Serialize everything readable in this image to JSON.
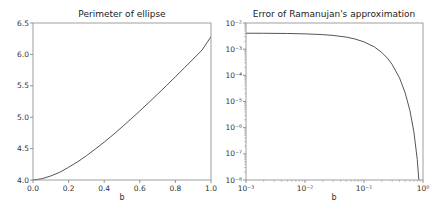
{
  "chart_data": [
    {
      "type": "line",
      "title": "Perimeter of ellipse",
      "xlabel": "b",
      "ylabel": "",
      "xscale": "linear",
      "yscale": "linear",
      "xlim": [
        0.0,
        1.0
      ],
      "ylim": [
        4.0,
        6.5
      ],
      "grid": false,
      "xticks": [
        "0.0",
        "0.2",
        "0.4",
        "0.6",
        "0.8",
        "1.0"
      ],
      "xtick_values": [
        0.0,
        0.2,
        0.4,
        0.6,
        0.8,
        1.0
      ],
      "yticks": [
        "4.0",
        "4.5",
        "5.0",
        "5.5",
        "6.0",
        "6.5"
      ],
      "ytick_values": [
        4.0,
        4.5,
        5.0,
        5.5,
        6.0,
        6.5
      ],
      "series": [
        {
          "name": "perimeter",
          "color": "#555555",
          "x": [
            0.0,
            0.05,
            0.1,
            0.15,
            0.2,
            0.25,
            0.3,
            0.35,
            0.4,
            0.45,
            0.5,
            0.55,
            0.6,
            0.65,
            0.7,
            0.75,
            0.8,
            0.85,
            0.9,
            0.95,
            1.0
          ],
          "y": [
            4.0,
            4.02,
            4.064,
            4.123,
            4.202,
            4.288,
            4.386,
            4.493,
            4.603,
            4.72,
            4.844,
            4.97,
            5.1,
            5.232,
            5.367,
            5.504,
            5.643,
            5.784,
            5.926,
            6.07,
            6.283
          ]
        }
      ]
    },
    {
      "type": "line",
      "title": "Error of Ramanujan's approximation",
      "xlabel": "b",
      "ylabel": "",
      "xscale": "log",
      "yscale": "log",
      "xlim": [
        0.001,
        1.0
      ],
      "ylim": [
        1e-08,
        0.01
      ],
      "grid": false,
      "xticks": [
        "10⁻³",
        "10⁻²",
        "10⁻¹",
        "10⁰"
      ],
      "xtick_values": [
        -3,
        -2,
        -1,
        0
      ],
      "yticks": [
        "10⁻⁸",
        "10⁻⁷",
        "10⁻⁶",
        "10⁻⁵",
        "10⁻⁴",
        "10⁻³",
        "10⁻²"
      ],
      "ytick_values": [
        -8,
        -7,
        -6,
        -5,
        -4,
        -3,
        -2
      ],
      "series": [
        {
          "name": "error",
          "color": "#555555",
          "x": [
            0.001,
            0.002,
            0.005,
            0.01,
            0.02,
            0.03,
            0.05,
            0.07,
            0.1,
            0.15,
            0.2,
            0.25,
            0.3,
            0.4,
            0.5,
            0.6,
            0.7,
            0.8,
            0.85
          ],
          "y": [
            0.00407,
            0.00405,
            0.00398,
            0.00385,
            0.0036,
            0.00335,
            0.0029,
            0.00245,
            0.0019,
            0.00122,
            0.00075,
            0.00045,
            0.00026,
            8e-05,
            2.1e-05,
            4.5e-06,
            7e-07,
            6e-08,
            1e-08
          ]
        }
      ]
    }
  ]
}
